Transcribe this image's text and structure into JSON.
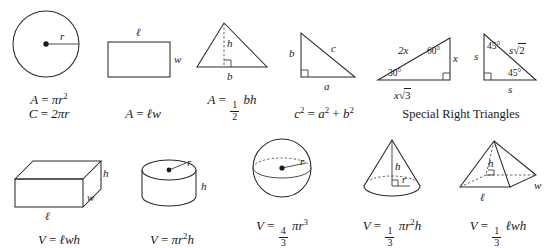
{
  "sheet": {
    "title": "Geometry Formula Reference",
    "background_color": "#ffffff",
    "ink_color": "#1a1a1a"
  },
  "top_row": {
    "items": [
      {
        "name": "circle",
        "shape_label": "circle-diagram",
        "labels": {
          "radius": "r"
        },
        "formula_line_1": {
          "lhs": "A",
          "eq": "=",
          "rhs_base": "πr",
          "rhs_exp": "2"
        },
        "formula_line_2": {
          "lhs": "C",
          "eq": "=",
          "rhs": "2πr"
        }
      },
      {
        "name": "rectangle",
        "shape_label": "rectangle-diagram",
        "labels": {
          "length": "ℓ",
          "width": "w"
        },
        "formula": {
          "lhs": "A",
          "eq": "=",
          "rhs": "ℓw"
        }
      },
      {
        "name": "triangle",
        "shape_label": "triangle-diagram",
        "labels": {
          "height": "h",
          "base": "b"
        },
        "formula": {
          "lhs": "A",
          "eq": "=",
          "frac_num": "1",
          "frac_den": "2",
          "rhs": "bh"
        }
      },
      {
        "name": "right-triangle",
        "shape_label": "right-triangle-diagram",
        "labels": {
          "leg_vertical": "b",
          "leg_horizontal": "a",
          "hypotenuse": "c"
        },
        "formula": {
          "lhs": "c",
          "lhs_exp": "2",
          "eq": "=",
          "term1": "a",
          "term1_exp": "2",
          "plus": "+",
          "term2": "b",
          "term2_exp": "2"
        }
      },
      {
        "name": "special-right-triangle-30-60-90",
        "shape_label": "triangle-30-60-90-diagram",
        "labels": {
          "hypotenuse": "2x",
          "angle_top": "60°",
          "angle_left": "30°",
          "side_vertical": "x",
          "side_base": "x√3",
          "side_base_coef": "x",
          "side_base_radicand": "3"
        }
      },
      {
        "name": "special-right-triangle-45-45-90",
        "shape_label": "triangle-45-45-90-diagram",
        "labels": {
          "leg_vertical": "s",
          "leg_horizontal": "s",
          "hypotenuse": "s√2",
          "hypotenuse_coef": "s",
          "hypotenuse_radicand": "2",
          "angle_top": "45°",
          "angle_bottom": "45°"
        },
        "caption": "Special Right Triangles"
      }
    ]
  },
  "bottom_row": {
    "items": [
      {
        "name": "rectangular-prism",
        "shape_label": "rectangular-prism-diagram",
        "labels": {
          "height": "h",
          "width": "w",
          "length": "ℓ"
        },
        "formula": {
          "lhs": "V",
          "eq": "=",
          "rhs": "ℓwh"
        }
      },
      {
        "name": "cylinder",
        "shape_label": "cylinder-diagram",
        "labels": {
          "radius": "r",
          "height": "h"
        },
        "formula": {
          "lhs": "V",
          "eq": "=",
          "rhs_base": "πr",
          "rhs_exp": "2",
          "rhs_tail": "h"
        }
      },
      {
        "name": "sphere",
        "shape_label": "sphere-diagram",
        "labels": {
          "radius": "r"
        },
        "formula": {
          "lhs": "V",
          "eq": "=",
          "frac_num": "4",
          "frac_den": "3",
          "rhs_base": "πr",
          "rhs_exp": "3"
        }
      },
      {
        "name": "cone",
        "shape_label": "cone-diagram",
        "labels": {
          "height": "h",
          "radius": "r"
        },
        "formula": {
          "lhs": "V",
          "eq": "=",
          "frac_num": "1",
          "frac_den": "3",
          "rhs_base": "πr",
          "rhs_exp": "2",
          "rhs_tail": "h"
        }
      },
      {
        "name": "pyramid",
        "shape_label": "pyramid-diagram",
        "labels": {
          "height": "h",
          "width": "w",
          "length": "ℓ"
        },
        "formula": {
          "lhs": "V",
          "eq": "=",
          "frac_num": "1",
          "frac_den": "3",
          "rhs": "ℓwh"
        }
      }
    ]
  }
}
